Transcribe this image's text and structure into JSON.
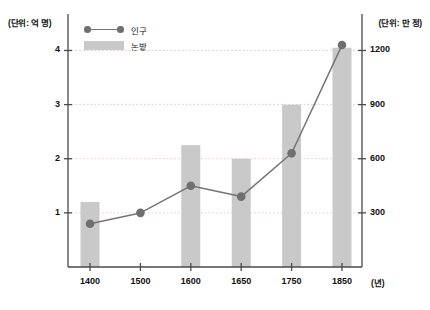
{
  "axes": {
    "left_unit": "(단위: 억 명)",
    "right_unit": "(단위: 만 정)",
    "x_axis_name": "(년)"
  },
  "legend": {
    "items": [
      {
        "label": "인구",
        "marker": "line-dot",
        "color": "#6f6f6f"
      },
      {
        "label": "논밭",
        "marker": "bar-swatch",
        "color": "#c9c9c9"
      }
    ]
  },
  "colors": {
    "bar": "#c9c9c9",
    "line": "#757575",
    "dot": "#6f6f6f",
    "grid": "#e8c9cc",
    "axis": "#4a4a4a",
    "text": "#111111"
  },
  "chart_data": {
    "type": "bar",
    "title": "",
    "xlabel": "(년)",
    "ylabel": "(단위: 억 명)",
    "y2label": "(단위: 만 정)",
    "categories": [
      "1400",
      "1500",
      "1600",
      "1650",
      "1750",
      "1850"
    ],
    "left_ticks": [
      "1",
      "2",
      "3",
      "4"
    ],
    "left_tick_values": [
      1,
      2,
      3,
      4
    ],
    "right_ticks": [
      "300",
      "600",
      "900",
      "1200"
    ],
    "right_tick_values": [
      300,
      600,
      900,
      1200
    ],
    "ylim": [
      0,
      4.6
    ],
    "y2lim": [
      0,
      1380
    ],
    "grid": true,
    "legend_position": "top-left",
    "series": [
      {
        "name": "인구",
        "type": "line",
        "axis": "left",
        "unit": "억 명",
        "values": [
          0.8,
          1.0,
          1.5,
          1.3,
          2.1,
          4.1
        ]
      },
      {
        "name": "논밭",
        "type": "bar",
        "axis": "right",
        "unit": "만 정",
        "values": [
          360,
          null,
          675,
          600,
          900,
          1215
        ]
      }
    ]
  }
}
